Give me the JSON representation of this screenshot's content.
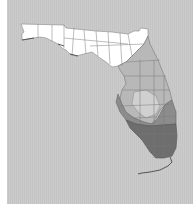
{
  "map": {
    "region": "Florida",
    "subdivisions": "counties",
    "colors": {
      "background": "#c8c8c8",
      "left_margin": "#ffffff",
      "zone_north": "#ffffff",
      "zone_central": "#b8b8b8",
      "zone_south_mid": "#8c8c8c",
      "zone_south": "#6e6e6e",
      "county_border": "#777777"
    },
    "zones": [
      {
        "name": "zone-north",
        "shade": "white"
      },
      {
        "name": "zone-central",
        "shade": "light-gray"
      },
      {
        "name": "zone-south",
        "shade": "dark-gray"
      }
    ]
  }
}
